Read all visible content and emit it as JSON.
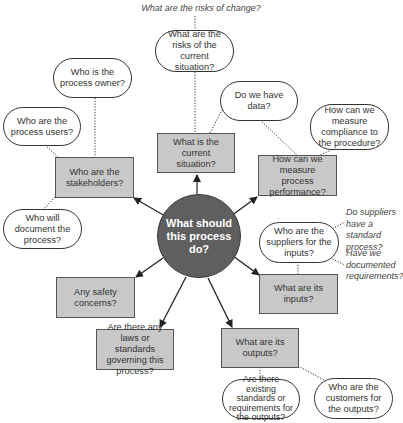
{
  "diagram": {
    "type": "mind-map",
    "center": "What should this process do?",
    "branches": [
      {
        "label": "What is the current situation?",
        "details": [
          "What are the risks of the current situation?",
          "Do we have data?"
        ],
        "notes": [
          "What are the risks of change?"
        ]
      },
      {
        "label": "How can we measure process performance?",
        "details": [
          "How can we measure compliance to the procedure?"
        ]
      },
      {
        "label": "What are its inputs?",
        "details": [
          "Who are the suppliers for the inputs?"
        ],
        "notes": [
          "Do suppliers have a standard process?",
          "Have we documented requirements?"
        ]
      },
      {
        "label": "What are its outputs?",
        "details": [
          "Are there existing standards or requirements for the outputs?",
          "Who are the customers for the outputs?"
        ]
      },
      {
        "label": "Are there any laws or standards governing this process?",
        "details": []
      },
      {
        "label": "Any safety concerns?",
        "details": []
      },
      {
        "label": "Who are the stakeholders?",
        "details": [
          "Who is the process owner?",
          "Who are the process users?",
          "Who will document the process?"
        ]
      }
    ]
  },
  "labels": {
    "top_note": "What are the risks of change?",
    "risks_current": "What are the risks of the current situation?",
    "process_owner": "Who is the process owner?",
    "process_users": "Who are the process users?",
    "stakeholders": "Who are the stakeholders?",
    "document": "Who will document the process?",
    "current_situation": "What is the current situation?",
    "have_data": "Do we have data?",
    "measure_compliance": "How can we measure compliance to the procedure?",
    "measure_performance": "How can we measure process performance?",
    "center": "What should this process do?",
    "suppliers_standard_note": "Do suppliers have a standard process?",
    "suppliers": "Who are the suppliers for the inputs?",
    "documented_req_note": "Have we documented requirements?",
    "inputs": "What are its inputs?",
    "safety": "Any safety concerns?",
    "laws": "Are there any laws or standards governing this process?",
    "outputs": "What are its outputs?",
    "existing_standards": "Are there existing standards or requirements for the outputs?",
    "customers": "Who are the customers for the outputs?"
  },
  "colors": {
    "box_fill": "#c8c8c8",
    "hub_fill": "#5f5f5f",
    "line": "#222222"
  }
}
